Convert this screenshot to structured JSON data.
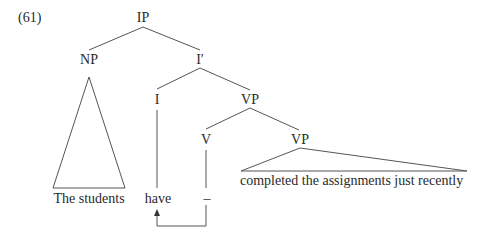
{
  "example_number": "(61)",
  "nodes": {
    "ip": "IP",
    "np": "NP",
    "i_bar": "I′",
    "i": "I",
    "vp_upper": "VP",
    "v": "V",
    "vp_lower": "VP"
  },
  "leaves": {
    "subject": "The students",
    "aux": "have",
    "trace": "–",
    "predicate": "completed the assignments just recently"
  },
  "colors": {
    "line": "#555555",
    "text": "#2a2a2a",
    "background": "#ffffff"
  }
}
